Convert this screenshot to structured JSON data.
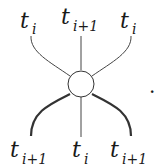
{
  "diagram": {
    "type": "vertex-diagram",
    "top_labels": [
      {
        "base": "t",
        "sub": "i"
      },
      {
        "base": "t",
        "sub": "i+1"
      },
      {
        "base": "t",
        "sub": "i"
      }
    ],
    "bottom_labels": [
      {
        "base": "t",
        "sub": "i+1"
      },
      {
        "base": "t",
        "sub": "i"
      },
      {
        "base": "t",
        "sub": "i+1"
      }
    ],
    "trailing_punctuation": ".",
    "node": {
      "shape": "circle",
      "fill": "#ffffff",
      "stroke": "#333333"
    },
    "colors": {
      "line": "#333333",
      "text": "#1a1a1a"
    }
  }
}
